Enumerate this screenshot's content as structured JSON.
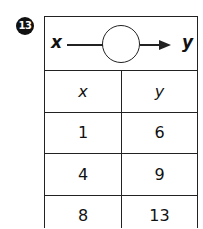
{
  "problem_number": "13",
  "function_machine": {
    "input_label": "x",
    "output_label": "y",
    "rule": ""
  },
  "table": {
    "headers": [
      "x",
      "y"
    ],
    "rows": [
      {
        "x": "1",
        "y": "6"
      },
      {
        "x": "4",
        "y": "9"
      },
      {
        "x": "8",
        "y": "13"
      }
    ]
  }
}
